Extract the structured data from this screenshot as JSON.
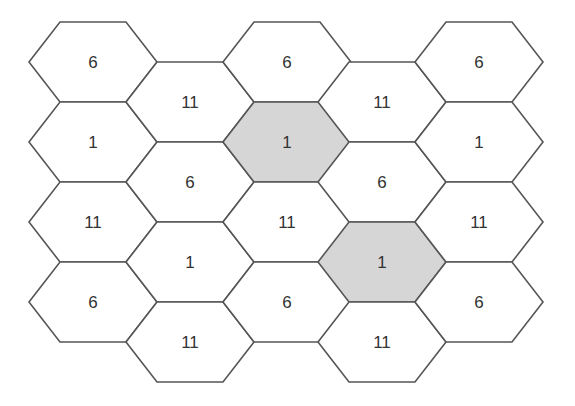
{
  "diagram": {
    "type": "hexagonal-cell-grid",
    "colors": {
      "stroke": "#555555",
      "fill_default": "#ffffff",
      "fill_highlight": "#d6d6d6",
      "text": "#333333"
    },
    "geometry": {
      "hex_width": 128,
      "hex_height": 80,
      "slant": 31,
      "column_lefts": [
        29,
        126,
        223,
        318,
        415
      ],
      "row_height": 80,
      "odd_column_top": 22,
      "even_column_top": 62
    },
    "columns": [
      {
        "cells": [
          {
            "label": "6",
            "highlighted": false
          },
          {
            "label": "1",
            "highlighted": false
          },
          {
            "label": "11",
            "highlighted": false
          },
          {
            "label": "6",
            "highlighted": false
          }
        ]
      },
      {
        "cells": [
          {
            "label": "11",
            "highlighted": false
          },
          {
            "label": "6",
            "highlighted": false
          },
          {
            "label": "1",
            "highlighted": false
          },
          {
            "label": "11",
            "highlighted": false
          }
        ]
      },
      {
        "cells": [
          {
            "label": "6",
            "highlighted": false
          },
          {
            "label": "1",
            "highlighted": true
          },
          {
            "label": "11",
            "highlighted": false
          },
          {
            "label": "6",
            "highlighted": false
          }
        ]
      },
      {
        "cells": [
          {
            "label": "11",
            "highlighted": false
          },
          {
            "label": "6",
            "highlighted": false
          },
          {
            "label": "1",
            "highlighted": true
          },
          {
            "label": "11",
            "highlighted": false
          }
        ]
      },
      {
        "cells": [
          {
            "label": "6",
            "highlighted": false
          },
          {
            "label": "1",
            "highlighted": false
          },
          {
            "label": "11",
            "highlighted": false
          },
          {
            "label": "6",
            "highlighted": false
          }
        ]
      }
    ]
  }
}
